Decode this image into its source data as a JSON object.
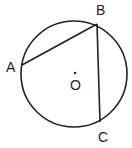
{
  "diagram": {
    "type": "geometry",
    "colors": {
      "stroke": "#222222",
      "background": "#ffffff"
    },
    "circle": {
      "center_label": "O",
      "cx": 74,
      "cy": 74,
      "r": 53
    },
    "points": [
      {
        "id": "A",
        "label": "A",
        "x": 22,
        "y": 65,
        "label_x": 6,
        "label_y": 72
      },
      {
        "id": "B",
        "label": "B",
        "x": 97,
        "y": 24,
        "label_x": 96,
        "label_y": 15
      },
      {
        "id": "C",
        "label": "C",
        "x": 100,
        "y": 122,
        "label_x": 98,
        "label_y": 142
      }
    ],
    "center": {
      "label": "O",
      "x": 75,
      "y": 73,
      "label_x": 70,
      "label_y": 90
    },
    "segments": [
      {
        "from": "A",
        "to": "B",
        "name": "chord-ab"
      },
      {
        "from": "B",
        "to": "C",
        "name": "chord-bc"
      }
    ]
  }
}
